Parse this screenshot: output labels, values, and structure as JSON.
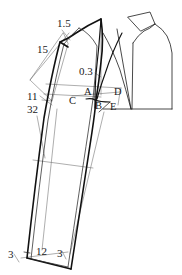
{
  "diagram": {
    "kind": "sewing-pattern-draft",
    "background_color": "#ffffff",
    "line_color": "#1a1a1a",
    "thin_line_color": "#5a5a5a",
    "measurements": [
      {
        "id": "m-1-5",
        "text": "1.5",
        "x": 57,
        "y": 23
      },
      {
        "id": "m-15",
        "text": "15",
        "x": 37,
        "y": 49
      },
      {
        "id": "m-0-3",
        "text": "0.3",
        "x": 82,
        "y": 72
      },
      {
        "id": "m-11",
        "text": "11",
        "x": 28,
        "y": 97
      },
      {
        "id": "m-32",
        "text": "32",
        "x": 28,
        "y": 110
      },
      {
        "id": "m-3-left",
        "text": "3",
        "x": 9,
        "y": 255
      },
      {
        "id": "m-12",
        "text": "12",
        "x": 37,
        "y": 251
      },
      {
        "id": "m-3-right",
        "text": "3",
        "x": 58,
        "y": 254
      }
    ],
    "points": [
      {
        "id": "pt-A",
        "text": "A",
        "x": 85,
        "y": 92
      },
      {
        "id": "pt-B",
        "text": "B",
        "x": 96,
        "y": 106
      },
      {
        "id": "pt-C",
        "text": "C",
        "x": 70,
        "y": 101
      },
      {
        "id": "pt-D",
        "text": "D",
        "x": 115,
        "y": 92
      },
      {
        "id": "pt-E",
        "text": "E",
        "x": 111,
        "y": 107
      }
    ]
  }
}
